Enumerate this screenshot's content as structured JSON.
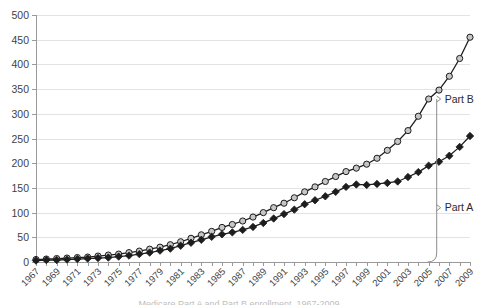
{
  "chart_data": {
    "type": "line",
    "title": "",
    "xlabel": "",
    "ylabel": "",
    "ylim": [
      0,
      500
    ],
    "yticks": [
      0,
      50,
      100,
      150,
      200,
      250,
      300,
      350,
      400,
      450,
      500
    ],
    "ytick_labels": [
      "0",
      "50",
      "100",
      "150",
      "200",
      "250",
      "300",
      "350",
      "400",
      "450",
      "500"
    ],
    "grid": true,
    "legend_position": "none",
    "xlim": [
      1967,
      2009
    ],
    "x": [
      1967,
      1968,
      1969,
      1970,
      1971,
      1972,
      1973,
      1974,
      1975,
      1976,
      1977,
      1978,
      1979,
      1980,
      1981,
      1982,
      1983,
      1984,
      1985,
      1986,
      1987,
      1988,
      1989,
      1990,
      1991,
      1992,
      1993,
      1994,
      1995,
      1996,
      1997,
      1998,
      1999,
      2000,
      2001,
      2002,
      2003,
      2004,
      2005,
      2006,
      2007,
      2008,
      2009
    ],
    "xtick_labels": [
      "1967",
      "1969",
      "1971",
      "1973",
      "1975",
      "1977",
      "1979",
      "1981",
      "1983",
      "1985",
      "1987",
      "1989",
      "1991",
      "1993",
      "1995",
      "1997",
      "1999",
      "2001",
      "2003",
      "2005",
      "2007",
      "2009"
    ],
    "xtick_values": [
      1967,
      1969,
      1971,
      1973,
      1975,
      1977,
      1979,
      1981,
      1983,
      1985,
      1987,
      1989,
      1991,
      1993,
      1995,
      1997,
      1999,
      2001,
      2003,
      2005,
      2007,
      2009
    ],
    "series": [
      {
        "name": "Part B",
        "marker": "circle",
        "marker_fill": "#c6c6c6",
        "marker_edge": "#1d1d1d",
        "line_color": "#1d1d1d",
        "values": [
          5,
          6,
          7,
          8,
          9,
          10,
          12,
          14,
          16,
          19,
          22,
          26,
          30,
          35,
          41,
          48,
          55,
          62,
          70,
          76,
          83,
          91,
          100,
          110,
          119,
          130,
          142,
          152,
          163,
          173,
          183,
          190,
          198,
          210,
          226,
          244,
          266,
          295,
          330,
          348,
          376,
          412,
          455
        ]
      },
      {
        "name": "Part A",
        "marker": "diamond",
        "marker_fill": "#1d1d1d",
        "marker_edge": "#1d1d1d",
        "line_color": "#1d1d1d",
        "values": [
          3,
          4,
          4,
          5,
          6,
          7,
          8,
          9,
          11,
          13,
          16,
          19,
          23,
          27,
          33,
          39,
          45,
          51,
          56,
          60,
          65,
          71,
          79,
          88,
          97,
          106,
          117,
          125,
          133,
          142,
          152,
          157,
          156,
          158,
          160,
          163,
          172,
          182,
          195,
          203,
          215,
          233,
          255
        ]
      }
    ],
    "annotations": [
      {
        "label": "Part B",
        "at_x": 2005,
        "at_value": 330
      },
      {
        "label": "Part A",
        "at_value": 110
      }
    ]
  },
  "caption": {
    "sliver_text": "Medicare Part A and Part B enrollment, 1967-2009"
  }
}
